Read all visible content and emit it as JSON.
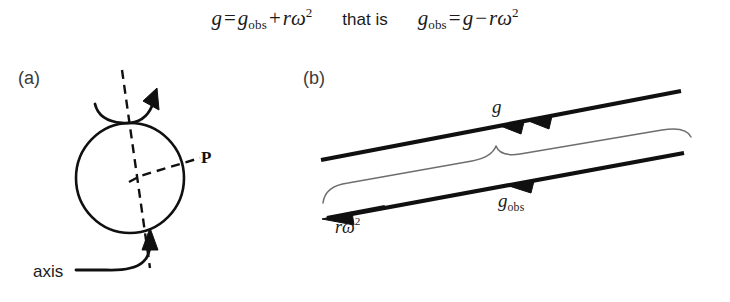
{
  "figure": {
    "background_color": "#ffffff",
    "ink_color": "#101010",
    "brace_color": "#6e6e6e"
  },
  "equations": {
    "left": {
      "lhs": "g",
      "equals": "=",
      "term1_base": "g",
      "term1_sub": "obs",
      "operator": "+",
      "term2_r": "r",
      "term2_omega": "ω",
      "term2_exp": "2"
    },
    "connector": "that is",
    "right": {
      "lhs_base": "g",
      "lhs_sub": "obs",
      "equals": "=",
      "term1": "g",
      "operator": "−",
      "term2_r": "r",
      "term2_omega": "ω",
      "term2_exp": "2"
    }
  },
  "panel_a": {
    "label": "(a)",
    "point_label": "P",
    "axis_label": "axis",
    "icons": {
      "sphere": "circle-outline",
      "rotation_axis": "dashed-axis-line",
      "radius": "dashed-radius-line",
      "spin_arrow": "curved-rotation-arrow",
      "axis_leader": "curved-leader-arrow"
    }
  },
  "panel_b": {
    "label": "(b)",
    "vectors": [
      {
        "name": "g",
        "label_base": "g",
        "label_sub": "",
        "arrowheads": 2
      },
      {
        "name": "g_obs",
        "label_base": "g",
        "label_sub": "obs",
        "arrowheads": 1
      },
      {
        "name": "r_omega2",
        "label_r": "r",
        "label_omega": "ω",
        "label_exp": "2",
        "arrowheads": 1
      }
    ],
    "icons": {
      "brace": "curly-brace-horizontal",
      "vector_g": "vector-arrow-left",
      "vector_gobs": "vector-arrow-left",
      "vector_romega": "vector-arrow-left"
    }
  }
}
